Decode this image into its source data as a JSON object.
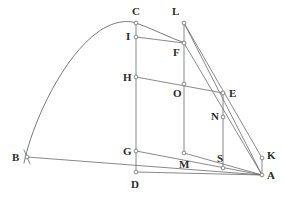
{
  "figure": {
    "width": 285,
    "height": 197,
    "background_color": "#ffffff",
    "stroke_color": "#6b6b6b",
    "label_color": "#2b2b2b",
    "vertex_marker": "small-open-circle"
  },
  "points": [
    {
      "id": "A",
      "label": "A",
      "x": 262,
      "y": 175,
      "label_x": 267,
      "label_y": 170,
      "marker": true
    },
    {
      "id": "B",
      "label": "B",
      "x": 27,
      "y": 157,
      "label_x": 12,
      "label_y": 152,
      "marker": true
    },
    {
      "id": "C",
      "label": "C",
      "x": 136,
      "y": 23,
      "label_x": 132,
      "label_y": 6,
      "marker": true
    },
    {
      "id": "D",
      "label": "D",
      "x": 136,
      "y": 172,
      "label_x": 131,
      "label_y": 179,
      "marker": true
    },
    {
      "id": "E",
      "label": "E",
      "x": 223,
      "y": 93,
      "label_x": 229,
      "label_y": 88,
      "marker": true
    },
    {
      "id": "F",
      "label": "F",
      "x": 184,
      "y": 43,
      "label_x": 173,
      "label_y": 47,
      "marker": true
    },
    {
      "id": "G",
      "label": "G",
      "x": 136,
      "y": 151,
      "label_x": 123,
      "label_y": 146,
      "marker": true
    },
    {
      "id": "H",
      "label": "H",
      "x": 136,
      "y": 77,
      "label_x": 123,
      "label_y": 72,
      "marker": true
    },
    {
      "id": "I",
      "label": "I",
      "x": 136,
      "y": 37,
      "label_x": 126,
      "label_y": 31,
      "marker": true
    },
    {
      "id": "K",
      "label": "K",
      "x": 262,
      "y": 158,
      "label_x": 267,
      "label_y": 150,
      "marker": true
    },
    {
      "id": "L",
      "label": "L",
      "x": 184,
      "y": 23,
      "label_x": 172,
      "label_y": 6,
      "marker": true
    },
    {
      "id": "M",
      "label": "M",
      "x": 184,
      "y": 153,
      "label_x": 179,
      "label_y": 159,
      "marker": true
    },
    {
      "id": "N",
      "label": "N",
      "x": 223,
      "y": 117,
      "label_x": 211,
      "label_y": 111,
      "marker": true
    },
    {
      "id": "O",
      "label": "O",
      "x": 184,
      "y": 84,
      "label_x": 173,
      "label_y": 88,
      "marker": true
    },
    {
      "id": "S",
      "label": "S",
      "x": 223,
      "y": 168,
      "label_x": 217,
      "label_y": 153,
      "marker": true
    }
  ],
  "segments": [
    {
      "name": "segment-B-A",
      "from": "B",
      "to": "A"
    },
    {
      "name": "segment-D-A",
      "from": "D",
      "to": "A"
    },
    {
      "name": "segment-C-D",
      "from": "C",
      "to": "D"
    },
    {
      "name": "segment-G-A",
      "from": "G",
      "to": "A"
    },
    {
      "name": "segment-H-E",
      "from": "H",
      "to": "E"
    },
    {
      "name": "segment-I-F",
      "from": "I",
      "to": "F"
    },
    {
      "name": "segment-L-M",
      "from": "L",
      "to": "M"
    },
    {
      "name": "segment-E-S",
      "from": "E",
      "to": "S"
    },
    {
      "name": "segment-L-A",
      "from": "L",
      "to": "A"
    },
    {
      "name": "segment-L-K",
      "from": "L",
      "to": "K"
    },
    {
      "name": "segment-F-A",
      "from": "F",
      "to": "A"
    },
    {
      "name": "segment-K-A",
      "from": "K",
      "to": "A"
    },
    {
      "name": "segment-M-A",
      "from": "M",
      "to": "A"
    }
  ],
  "arc": {
    "name": "parabolic-arc-B-C-F",
    "description": "curve passing through B, apex near C, descending to F",
    "path": "M 24 163 C 33 120, 64 56, 98 32 C 113 21, 128 20, 136 23 C 151 28, 170 38, 185 43"
  },
  "ticks": [
    {
      "name": "tick-at-B",
      "x1": 24,
      "y1": 150,
      "x2": 30,
      "y2": 164
    }
  ]
}
